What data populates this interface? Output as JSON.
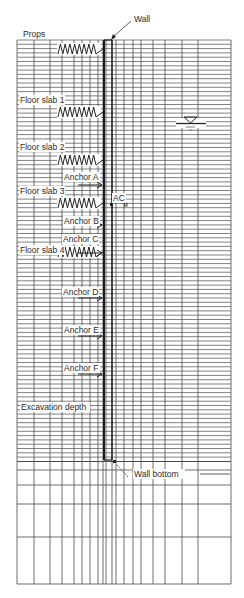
{
  "diagram": {
    "colors": {
      "background": "#ffffff",
      "grid_line": "#4a4a4a",
      "wall": "#1a1a1a",
      "text": "#2a2a2a"
    },
    "labels": {
      "wall": "Wall",
      "props": "Props",
      "floor_slab_1": "Floor slab 1",
      "floor_slab_2": "Floor slab 2",
      "floor_slab_3": "Floor slab 3",
      "floor_slab_4": "Floor slab 4",
      "anchor_a": "Anchor A",
      "anchor_b": "Anchor B",
      "anchor_c": "Anchor C",
      "anchor_d": "Anchor D",
      "anchor_e": "Anchor E",
      "anchor_f": "Anchor F",
      "ac": "AC",
      "excavation_depth": "Excavation depth",
      "wall_bottom": "Wall bottom"
    },
    "symbols": {
      "water_table": "water-table-icon",
      "spring": "spring-icon",
      "anchor_arrow": "arrow-right-icon"
    },
    "mesh": {
      "left": 17,
      "right": 231,
      "top": 40,
      "bottom": 584,
      "vertical_lines_x": [
        17,
        34,
        50,
        62,
        74,
        82,
        90,
        98,
        103,
        106,
        112,
        116,
        124,
        133,
        141,
        153,
        165,
        182,
        198,
        231
      ],
      "dense_row_spacing": 4.3,
      "dense_bottom": 460,
      "coarse_rows_y": [
        470,
        485,
        504,
        537,
        584
      ]
    },
    "wall": {
      "x": 104,
      "top": 40,
      "bottom": 460,
      "width": 2
    },
    "elements": {
      "springs_y": [
        49,
        112,
        160,
        203,
        252
      ],
      "anchors": [
        {
          "name": "A",
          "y": 185,
          "label_y": 175
        },
        {
          "name": "B",
          "y": 225,
          "label_y": 215
        },
        {
          "name": "C",
          "y": 253,
          "label_y": 238
        },
        {
          "name": "D",
          "y": 298,
          "label_y": 288
        },
        {
          "name": "E",
          "y": 336,
          "label_y": 326
        },
        {
          "name": "F",
          "y": 374,
          "label_y": 364
        }
      ]
    }
  }
}
